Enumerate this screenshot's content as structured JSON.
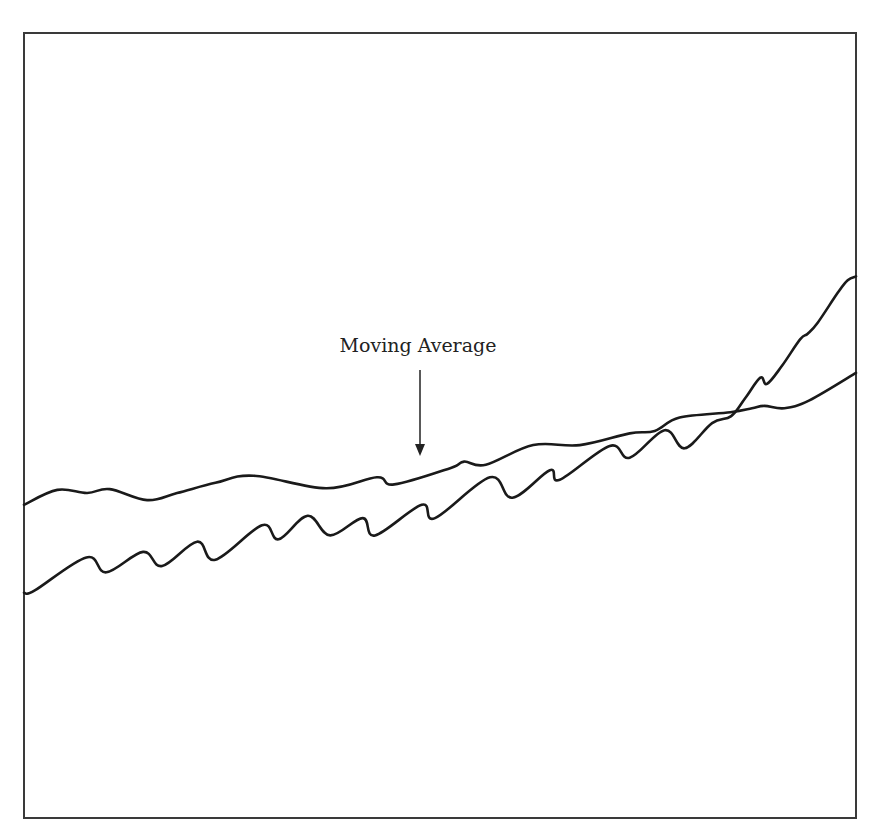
{
  "chart_data": {
    "type": "line",
    "title": "",
    "xlabel": "",
    "ylabel": "",
    "grid": false,
    "legend": null,
    "axes_visible": false,
    "xlim": [
      0,
      100
    ],
    "ylim": [
      0,
      100
    ],
    "annotations": [
      {
        "text": "Moving Average",
        "arrow_to": {
          "x": 47.6,
          "y": 46.5
        },
        "text_pos": {
          "x": 48.7,
          "y": 59.2
        }
      }
    ],
    "series": [
      {
        "name": "Price",
        "points": [
          [
            0.0,
            28.7
          ],
          [
            1.3,
            29.0
          ],
          [
            7.5,
            33.2
          ],
          [
            9.9,
            31.3
          ],
          [
            14.3,
            33.9
          ],
          [
            16.6,
            32.1
          ],
          [
            20.8,
            35.2
          ],
          [
            23.0,
            32.9
          ],
          [
            28.6,
            37.3
          ],
          [
            30.6,
            35.5
          ],
          [
            34.1,
            38.5
          ],
          [
            36.8,
            36.0
          ],
          [
            40.7,
            38.2
          ],
          [
            42.2,
            36.0
          ],
          [
            47.8,
            39.9
          ],
          [
            49.4,
            38.2
          ],
          [
            56.0,
            43.4
          ],
          [
            58.7,
            40.8
          ],
          [
            63.2,
            44.3
          ],
          [
            64.4,
            43.1
          ],
          [
            70.4,
            47.4
          ],
          [
            72.8,
            45.9
          ],
          [
            77.0,
            49.4
          ],
          [
            79.4,
            47.1
          ],
          [
            82.7,
            50.3
          ],
          [
            85.0,
            51.2
          ],
          [
            86.7,
            53.5
          ],
          [
            88.5,
            56.1
          ],
          [
            89.3,
            55.3
          ],
          [
            91.1,
            57.6
          ],
          [
            93.3,
            61.0
          ],
          [
            94.2,
            61.7
          ],
          [
            95.4,
            63.1
          ],
          [
            97.8,
            66.9
          ],
          [
            99.0,
            68.5
          ],
          [
            100.0,
            69.0
          ]
        ]
      },
      {
        "name": "Moving Average",
        "points": [
          [
            0.0,
            39.9
          ],
          [
            4.0,
            41.8
          ],
          [
            7.6,
            41.4
          ],
          [
            10.3,
            41.9
          ],
          [
            14.8,
            40.5
          ],
          [
            18.4,
            41.4
          ],
          [
            23.0,
            42.7
          ],
          [
            27.6,
            43.6
          ],
          [
            36.3,
            42.0
          ],
          [
            42.4,
            43.4
          ],
          [
            44.5,
            42.5
          ],
          [
            51.3,
            44.6
          ],
          [
            52.9,
            45.4
          ],
          [
            55.5,
            45.0
          ],
          [
            61.2,
            47.5
          ],
          [
            66.8,
            47.5
          ],
          [
            72.8,
            49.0
          ],
          [
            75.8,
            49.3
          ],
          [
            78.8,
            51.0
          ],
          [
            84.9,
            51.7
          ],
          [
            87.5,
            52.2
          ],
          [
            89.0,
            52.5
          ],
          [
            91.4,
            52.2
          ],
          [
            94.4,
            53.2
          ],
          [
            100.0,
            56.7
          ]
        ]
      }
    ]
  },
  "annotation": {
    "label": "Moving Average"
  }
}
